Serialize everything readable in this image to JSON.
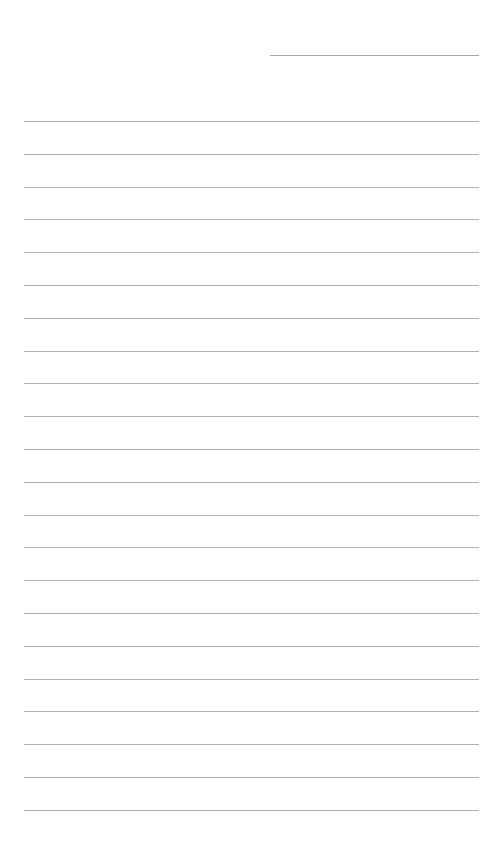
{
  "page": {
    "type": "lined-paper",
    "background": "#ffffff",
    "line_color": "#b0b0b0",
    "header_line": {
      "x": 270,
      "y": 55,
      "width": 209
    },
    "rules": {
      "count": 22,
      "start_y": 121,
      "spacing": 32.8,
      "x": 24,
      "width": 455
    }
  }
}
